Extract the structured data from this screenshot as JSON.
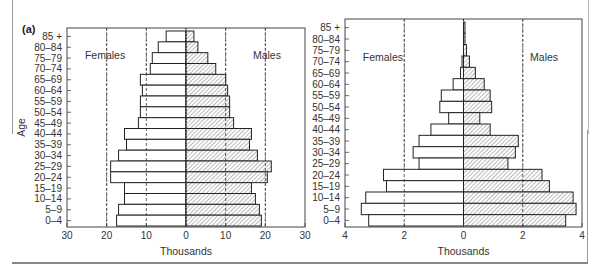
{
  "panel_label": "(a)",
  "chart_data": [
    {
      "type": "bar",
      "orientation": "horizontal-population-pyramid",
      "title": "",
      "ylabel": "Age",
      "xlabel": "Thousands",
      "side_labels": {
        "left": "Females",
        "right": "Males"
      },
      "xlim": [
        -30,
        30
      ],
      "xticks": [
        30,
        20,
        10,
        0,
        10,
        20,
        30
      ],
      "gridlines": [
        -20,
        -10,
        10,
        20
      ],
      "categories": [
        "85 +",
        "80–84",
        "75–79",
        "70–74",
        "65–69",
        "60–64",
        "55–59",
        "50–54",
        "45–49",
        "40–44",
        "35–39",
        "30–34",
        "25–29",
        "20–24",
        "15–19",
        "10–14",
        "5–9",
        "0–4"
      ],
      "series": [
        {
          "name": "Females",
          "fill": "open",
          "values": [
            5,
            7,
            8.5,
            9,
            11.5,
            11,
            11.5,
            11.5,
            12,
            15.5,
            15,
            17,
            19,
            19,
            15.5,
            15.5,
            17,
            17.5
          ]
        },
        {
          "name": "Males",
          "fill": "hatched",
          "values": [
            2,
            3,
            5.5,
            7.5,
            10,
            10.5,
            11,
            11,
            12,
            16.5,
            16,
            18,
            21.5,
            20.5,
            16.5,
            17.5,
            18.5,
            19
          ]
        }
      ]
    },
    {
      "type": "bar",
      "orientation": "horizontal-population-pyramid",
      "title": "",
      "ylabel": "",
      "xlabel": "Thousands",
      "side_labels": {
        "left": "Females",
        "right": "Males"
      },
      "xlim": [
        -4,
        4
      ],
      "xticks": [
        4,
        2,
        0,
        2,
        4
      ],
      "gridlines": [
        -2,
        2
      ],
      "categories": [
        "85 +",
        "80–84",
        "75–79",
        "70–74",
        "65–69",
        "60–64",
        "55–59",
        "50–54",
        "45–49",
        "40–44",
        "35–39",
        "30–34",
        "25–29",
        "20–24",
        "15–19",
        "10–14",
        "5–9",
        "0–4"
      ],
      "series": [
        {
          "name": "Females",
          "fill": "open",
          "values": [
            0,
            0,
            0,
            0.05,
            0.1,
            0.35,
            0.75,
            0.8,
            0.5,
            1.1,
            1.5,
            1.7,
            1.5,
            2.7,
            2.6,
            3.3,
            3.45,
            3.2
          ]
        },
        {
          "name": "Males",
          "fill": "hatched",
          "values": [
            0.05,
            0.05,
            0.1,
            0.2,
            0.4,
            0.7,
            0.9,
            0.95,
            0.55,
            0.9,
            1.85,
            1.75,
            1.5,
            2.65,
            2.9,
            3.7,
            3.8,
            3.45
          ]
        }
      ]
    }
  ]
}
